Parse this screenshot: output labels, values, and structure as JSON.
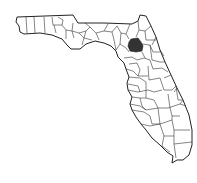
{
  "map": {
    "region": "Florida",
    "subdivision": "counties",
    "highlighted_county": {
      "fill": "#333333"
    },
    "colors": {
      "background": "#ffffff",
      "outline": "#222222",
      "county_fill": "#ffffff"
    }
  }
}
